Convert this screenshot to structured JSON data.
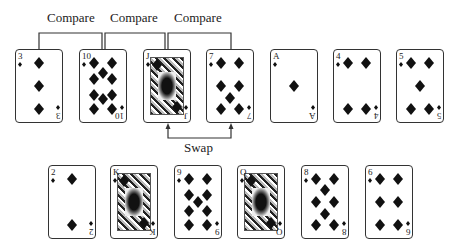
{
  "annotations": {
    "compare_labels": [
      "Compare",
      "Compare",
      "Compare"
    ],
    "swap_label": "Swap"
  },
  "rows": [
    {
      "name": "top-row",
      "cards": [
        {
          "rank": "3",
          "suit": "diamonds",
          "x": 15,
          "y": 49
        },
        {
          "rank": "10",
          "suit": "diamonds",
          "x": 79,
          "y": 49
        },
        {
          "rank": "J",
          "suit": "diamonds",
          "x": 143,
          "y": 49,
          "face": true
        },
        {
          "rank": "7",
          "suit": "diamonds",
          "x": 206,
          "y": 49
        },
        {
          "rank": "A",
          "suit": "diamonds",
          "x": 270,
          "y": 49
        },
        {
          "rank": "4",
          "suit": "diamonds",
          "x": 333,
          "y": 49
        },
        {
          "rank": "5",
          "suit": "diamonds",
          "x": 396,
          "y": 49
        }
      ]
    },
    {
      "name": "bottom-row",
      "cards": [
        {
          "rank": "2",
          "suit": "diamonds",
          "x": 48,
          "y": 165
        },
        {
          "rank": "K",
          "suit": "diamonds",
          "x": 110,
          "y": 165,
          "face": true
        },
        {
          "rank": "9",
          "suit": "diamonds",
          "x": 174,
          "y": 165
        },
        {
          "rank": "Q",
          "suit": "diamonds",
          "x": 237,
          "y": 165,
          "face": true
        },
        {
          "rank": "8",
          "suit": "diamonds",
          "x": 301,
          "y": 165
        },
        {
          "rank": "6",
          "suit": "diamonds",
          "x": 365,
          "y": 165
        }
      ]
    }
  ],
  "colors": {
    "ink": "#222222",
    "background": "#ffffff"
  }
}
